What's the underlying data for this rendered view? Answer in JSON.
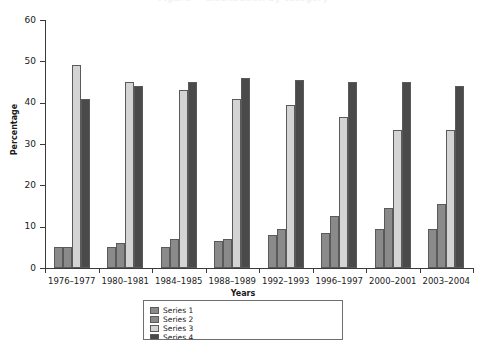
{
  "figure": {
    "title_cutoff": "Figure — distribution by category",
    "background": "#ffffff"
  },
  "axes": {
    "y_title": "Percentage",
    "x_title": "Years",
    "y_ticks": [
      "0",
      "10",
      "20",
      "30",
      "40",
      "50",
      "60"
    ],
    "x_labels": [
      "1976–1977",
      "1980–1981",
      "1984–1985",
      "1988–1989",
      "1992–1993",
      "1996–1997",
      "2000–2001",
      "2003–2004"
    ]
  },
  "colors": {
    "series_1": "#8a8a8a",
    "series_2": "#8a8a8a",
    "series_3": "#d4d4d4",
    "series_4": "#4a4a4a",
    "bar_outline": "#5a5a5a",
    "axis": "#3a3a3a",
    "text": "#1a1a1a"
  },
  "legend": {
    "visible_fraction": "top border only (clipped by image edge)",
    "entries": [
      {
        "label": "Series 1",
        "color": "#8a8a8a"
      },
      {
        "label": "Series 2",
        "color": "#8a8a8a"
      },
      {
        "label": "Series 3",
        "color": "#d4d4d4"
      },
      {
        "label": "Series 4",
        "color": "#4a4a4a"
      }
    ]
  },
  "chart_data": {
    "type": "bar",
    "title": "",
    "xlabel": "Years",
    "ylabel": "Percentage",
    "ylim": [
      0,
      60
    ],
    "ytick_step": 10,
    "grid": false,
    "legend_position": "bottom",
    "categories": [
      "1976–1977",
      "1980–1981",
      "1984–1985",
      "1988–1989",
      "1992–1993",
      "1996–1997",
      "2000–2001",
      "2003–2004"
    ],
    "series": [
      {
        "name": "Series 1",
        "color": "#8a8a8a",
        "values": [
          5.0,
          5.0,
          5.0,
          6.5,
          8.0,
          8.5,
          9.5,
          9.5
        ]
      },
      {
        "name": "Series 2",
        "color": "#8a8a8a",
        "values": [
          5.0,
          6.0,
          7.0,
          7.0,
          9.5,
          12.5,
          14.5,
          15.5
        ]
      },
      {
        "name": "Series 3",
        "color": "#d4d4d4",
        "values": [
          49.0,
          45.0,
          43.0,
          41.0,
          39.5,
          36.5,
          33.5,
          33.5
        ]
      },
      {
        "name": "Series 4",
        "color": "#4a4a4a",
        "values": [
          41.0,
          44.0,
          45.0,
          46.0,
          45.5,
          45.0,
          45.0,
          44.0
        ]
      }
    ]
  }
}
